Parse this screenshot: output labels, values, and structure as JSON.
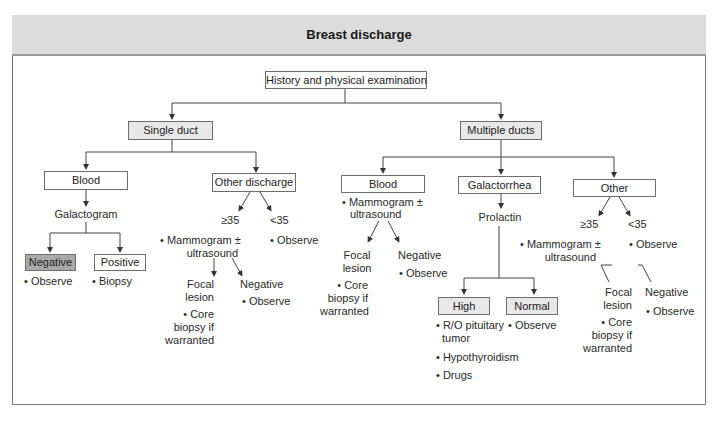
{
  "title": "Breast discharge",
  "root": "History and physical examination",
  "single_duct": {
    "label": "Single duct",
    "blood": {
      "label": "Blood",
      "next": "Galactogram",
      "negative": {
        "label": "Negative",
        "action": "• Observe"
      },
      "positive": {
        "label": "Positive",
        "action": "• Biopsy"
      }
    },
    "other": {
      "label": "Other discharge",
      "ge35": "≥35",
      "lt35": "<35",
      "ge35_action_1": "• Mammogram ±",
      "ge35_action_2": "ultrasound",
      "lt35_action": "• Observe",
      "focal_1": "Focal",
      "focal_2": "lesion",
      "focal_action_1": "• Core",
      "focal_action_2": "biopsy if",
      "focal_action_3": "warranted",
      "negative": "Negative",
      "negative_action": "• Observe"
    }
  },
  "multiple_ducts": {
    "label": "Multiple ducts",
    "blood": {
      "label": "Blood",
      "action_1": "• Mammogram ±",
      "action_2": "ultrasound",
      "focal_1": "Focal",
      "focal_2": "lesion",
      "focal_action_1": "• Core",
      "focal_action_2": "biopsy if",
      "focal_action_3": "warranted",
      "negative": "Negative",
      "negative_action": "• Observe"
    },
    "galactorrhea": {
      "label": "Galactorrhea",
      "next": "Prolactin",
      "high": {
        "label": "High",
        "actions": [
          "• R/O pituitary",
          "tumor",
          "• Hypothyroidism",
          "• Drugs"
        ]
      },
      "normal": {
        "label": "Normal",
        "action": "• Observe"
      }
    },
    "other": {
      "label": "Other",
      "ge35": "≥35",
      "lt35": "<35",
      "ge35_action_1": "• Mammogram ±",
      "ge35_action_2": "ultrasound",
      "lt35_action": "• Observe",
      "focal_1": "Focal",
      "focal_2": "lesion",
      "focal_action_1": "• Core",
      "focal_action_2": "biopsy if",
      "focal_action_3": "warranted",
      "negative": "Negative",
      "negative_action": "• Observe"
    }
  }
}
